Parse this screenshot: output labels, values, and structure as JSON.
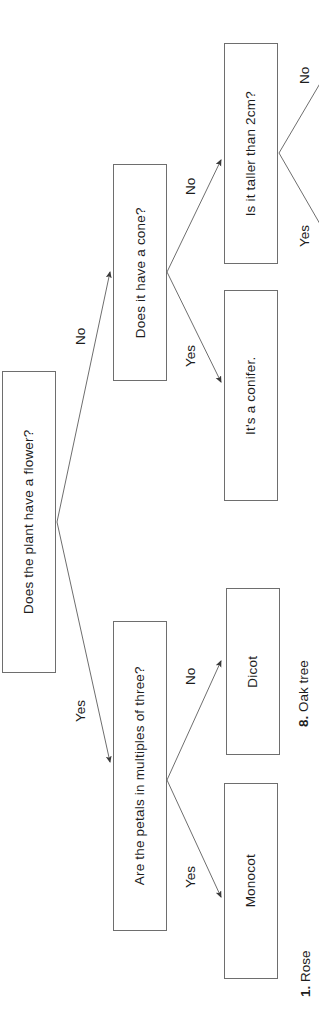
{
  "diagram": {
    "orientation": "rotated-90-ccw",
    "colors": {
      "box_border": "#6e6e6e",
      "edge_line": "#6e6e6e",
      "text": "#1d1d1d",
      "background": "#ffffff"
    },
    "nodes": [
      {
        "id": "root",
        "label": "Does the plant have a flower?"
      },
      {
        "id": "cone",
        "label": "Does it have a cone?"
      },
      {
        "id": "petals",
        "label": "Are the petals in multiples of three?"
      },
      {
        "id": "taller",
        "label": "Is it taller than 2cm?"
      },
      {
        "id": "conifer",
        "label": "It's a conifer."
      },
      {
        "id": "dicot",
        "label": "Dicot"
      },
      {
        "id": "monocot",
        "label": "Monocot"
      }
    ],
    "edges": [
      {
        "from": "root",
        "to": "cone",
        "label": "No"
      },
      {
        "from": "root",
        "to": "petals",
        "label": "Yes"
      },
      {
        "from": "cone",
        "to": "taller",
        "label": "No"
      },
      {
        "from": "cone",
        "to": "conifer",
        "label": "Yes"
      },
      {
        "from": "petals",
        "to": "dicot",
        "label": "No"
      },
      {
        "from": "petals",
        "to": "monocot",
        "label": "Yes"
      },
      {
        "from": "taller",
        "to": "",
        "label": "No"
      },
      {
        "from": "taller",
        "to": "",
        "label": "Yes"
      }
    ]
  },
  "captions": [
    {
      "number": "1.",
      "text": "Rose"
    },
    {
      "number": "8.",
      "text": "Oak tree"
    }
  ]
}
